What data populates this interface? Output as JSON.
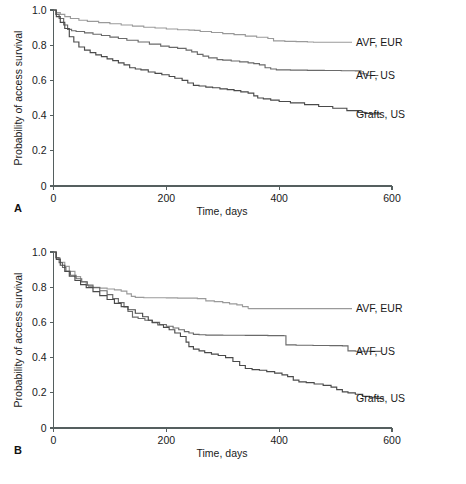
{
  "figure": {
    "background": "#ffffff",
    "panels": [
      {
        "key": "A",
        "label": "A"
      },
      {
        "key": "B",
        "label": "B"
      }
    ]
  },
  "axes": {
    "ylabel": "Probability of access survival",
    "xlabel": "Time, days",
    "yticks": [
      "0",
      "0.2",
      "0.4",
      "0.6",
      "0.8",
      "1.0"
    ],
    "ytick_values": [
      0,
      0.2,
      0.4,
      0.6,
      0.8,
      1.0
    ],
    "xticks": [
      "0",
      "200",
      "400",
      "600"
    ],
    "xtick_values": [
      0,
      200,
      400,
      600
    ],
    "xlim": [
      0,
      600
    ],
    "ylim": [
      0,
      1.0
    ]
  },
  "series_colors": {
    "avf_eur": "#9a9a9a",
    "avf_us": "#6a6a6a",
    "grafts_us": "#4a4a4a"
  },
  "labels": {
    "avf_eur": "AVF, EUR",
    "avf_us": "AVF, US",
    "grafts_us": "Grafts, US"
  },
  "chart_data": [
    {
      "type": "line",
      "panel": "A",
      "title": "",
      "xlabel": "Time, days",
      "ylabel": "Probability of access survival",
      "xlim": [
        0,
        600
      ],
      "ylim": [
        0,
        1.0
      ],
      "grid": false,
      "legend_position": "right-inline-labels",
      "step": "kaplan-meier",
      "series": [
        {
          "name": "AVF, EUR",
          "color": "#9a9a9a",
          "x": [
            0,
            5,
            12,
            20,
            30,
            45,
            60,
            80,
            100,
            120,
            140,
            160,
            180,
            200,
            220,
            240,
            250,
            260,
            280,
            300,
            320,
            340,
            360,
            380,
            390,
            410,
            430,
            450,
            460
          ],
          "y": [
            1.0,
            0.985,
            0.975,
            0.962,
            0.952,
            0.942,
            0.935,
            0.928,
            0.922,
            0.915,
            0.908,
            0.902,
            0.898,
            0.892,
            0.888,
            0.886,
            0.884,
            0.878,
            0.872,
            0.866,
            0.86,
            0.852,
            0.845,
            0.838,
            0.825,
            0.822,
            0.82,
            0.818,
            0.817
          ]
        },
        {
          "name": "AVF, US",
          "color": "#6a6a6a",
          "x": [
            0,
            4,
            10,
            18,
            25,
            32,
            40,
            55,
            70,
            85,
            100,
            115,
            130,
            150,
            170,
            190,
            205,
            220,
            235,
            245,
            255,
            265,
            275,
            290,
            300,
            315,
            330,
            345,
            355,
            365,
            375,
            385,
            395,
            420,
            450,
            480,
            510,
            535,
            545,
            555,
            575
          ],
          "y": [
            1.0,
            0.975,
            0.952,
            0.915,
            0.89,
            0.882,
            0.878,
            0.87,
            0.862,
            0.855,
            0.846,
            0.838,
            0.828,
            0.818,
            0.806,
            0.795,
            0.788,
            0.782,
            0.772,
            0.762,
            0.748,
            0.738,
            0.728,
            0.718,
            0.715,
            0.71,
            0.705,
            0.7,
            0.695,
            0.688,
            0.672,
            0.665,
            0.66,
            0.658,
            0.657,
            0.656,
            0.655,
            0.654,
            0.638,
            0.628,
            0.626
          ]
        },
        {
          "name": "Grafts, US",
          "color": "#4a4a4a",
          "x": [
            0,
            5,
            12,
            20,
            28,
            36,
            45,
            55,
            65,
            75,
            85,
            95,
            105,
            115,
            125,
            135,
            145,
            155,
            168,
            180,
            192,
            205,
            215,
            228,
            238,
            248,
            258,
            270,
            282,
            295,
            308,
            320,
            332,
            345,
            355,
            362,
            372,
            385,
            400,
            420,
            445,
            470,
            495,
            520,
            540,
            552,
            562,
            580
          ],
          "y": [
            1.0,
            0.962,
            0.93,
            0.895,
            0.848,
            0.818,
            0.79,
            0.772,
            0.758,
            0.745,
            0.735,
            0.722,
            0.712,
            0.7,
            0.688,
            0.672,
            0.665,
            0.66,
            0.648,
            0.64,
            0.632,
            0.622,
            0.612,
            0.6,
            0.585,
            0.572,
            0.568,
            0.562,
            0.558,
            0.552,
            0.548,
            0.542,
            0.535,
            0.528,
            0.512,
            0.5,
            0.495,
            0.488,
            0.48,
            0.472,
            0.462,
            0.452,
            0.442,
            0.428,
            0.418,
            0.412,
            0.41,
            0.409
          ]
        }
      ]
    },
    {
      "type": "line",
      "panel": "B",
      "title": "",
      "xlabel": "Time, days",
      "ylabel": "Probability of access survival",
      "xlim": [
        0,
        600
      ],
      "ylim": [
        0,
        1.0
      ],
      "grid": false,
      "legend_position": "right-inline-labels",
      "step": "kaplan-meier",
      "series": [
        {
          "name": "AVF, EUR",
          "color": "#9a9a9a",
          "x": [
            0,
            5,
            12,
            20,
            28,
            38,
            48,
            58,
            62,
            70,
            82,
            95,
            108,
            120,
            130,
            138,
            145,
            160,
            180,
            200,
            220,
            240,
            255,
            270,
            285,
            300,
            312,
            325,
            335,
            345
          ],
          "y": [
            1.0,
            0.965,
            0.942,
            0.918,
            0.89,
            0.86,
            0.832,
            0.812,
            0.805,
            0.8,
            0.795,
            0.79,
            0.785,
            0.778,
            0.762,
            0.748,
            0.742,
            0.74,
            0.74,
            0.739,
            0.738,
            0.738,
            0.735,
            0.722,
            0.718,
            0.712,
            0.705,
            0.7,
            0.69,
            0.678
          ]
        },
        {
          "name": "AVF, US",
          "color": "#6a6a6a",
          "x": [
            0,
            4,
            10,
            16,
            22,
            30,
            40,
            50,
            60,
            70,
            82,
            95,
            105,
            115,
            125,
            132,
            140,
            150,
            162,
            175,
            188,
            200,
            212,
            222,
            232,
            240,
            248,
            258,
            270,
            285,
            300,
            320,
            340,
            360,
            380,
            400,
            408,
            412,
            430,
            460,
            490,
            512,
            522,
            535,
            560,
            580
          ],
          "y": [
            1.0,
            0.968,
            0.94,
            0.912,
            0.89,
            0.868,
            0.848,
            0.83,
            0.812,
            0.798,
            0.78,
            0.758,
            0.735,
            0.712,
            0.688,
            0.662,
            0.63,
            0.622,
            0.612,
            0.6,
            0.588,
            0.578,
            0.568,
            0.558,
            0.548,
            0.54,
            0.532,
            0.53,
            0.528,
            0.528,
            0.527,
            0.527,
            0.526,
            0.526,
            0.525,
            0.525,
            0.524,
            0.472,
            0.47,
            0.469,
            0.468,
            0.467,
            0.438,
            0.436,
            0.435,
            0.434
          ]
        },
        {
          "name": "Grafts, US",
          "color": "#4a4a4a",
          "x": [
            0,
            5,
            12,
            20,
            28,
            38,
            48,
            58,
            70,
            82,
            95,
            108,
            120,
            132,
            145,
            158,
            168,
            175,
            185,
            195,
            205,
            215,
            225,
            235,
            240,
            248,
            258,
            268,
            280,
            292,
            305,
            318,
            330,
            340,
            352,
            365,
            378,
            392,
            405,
            415,
            425,
            435,
            448,
            462,
            478,
            492,
            502,
            512,
            522,
            535,
            548,
            560,
            572,
            585
          ],
          "y": [
            1.0,
            0.958,
            0.925,
            0.89,
            0.862,
            0.838,
            0.815,
            0.798,
            0.775,
            0.752,
            0.73,
            0.708,
            0.69,
            0.672,
            0.652,
            0.632,
            0.612,
            0.598,
            0.585,
            0.572,
            0.558,
            0.54,
            0.52,
            0.488,
            0.462,
            0.448,
            0.438,
            0.428,
            0.42,
            0.412,
            0.4,
            0.378,
            0.355,
            0.338,
            0.332,
            0.328,
            0.32,
            0.312,
            0.302,
            0.292,
            0.272,
            0.262,
            0.258,
            0.25,
            0.242,
            0.232,
            0.218,
            0.205,
            0.2,
            0.192,
            0.18,
            0.172,
            0.168,
            0.167
          ]
        }
      ]
    }
  ]
}
